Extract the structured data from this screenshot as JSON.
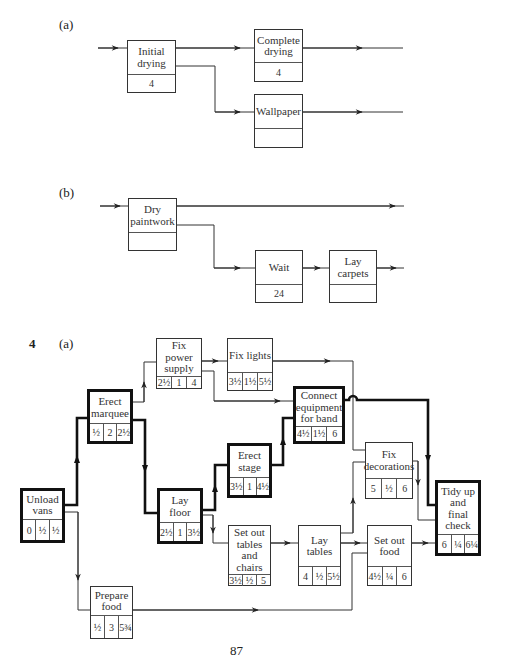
{
  "part_a": {
    "label": "(a)",
    "nodes": {
      "initial_drying": {
        "name": "Initial drying",
        "duration": "4"
      },
      "complete_drying": {
        "name": "Complete drying",
        "duration": "4"
      },
      "wallpaper": {
        "name": "Wallpaper",
        "duration": ""
      }
    }
  },
  "part_b": {
    "label": "(b)",
    "nodes": {
      "dry_paintwork": {
        "name": "Dry paintwork",
        "duration": ""
      },
      "wait": {
        "name": "Wait",
        "duration": "24"
      },
      "lay_carpets": {
        "name": "Lay carpets",
        "duration": ""
      }
    }
  },
  "question4": {
    "number": "4",
    "label": "(a)",
    "nodes": {
      "unload_vans": {
        "name": "Unload vans",
        "est": "0",
        "dur": "½",
        "eft": "½",
        "critical": true
      },
      "erect_marquee": {
        "name": "Erect marquee",
        "est": "½",
        "dur": "2",
        "eft": "2½",
        "critical": true
      },
      "fix_power_supply": {
        "name": "Fix power supply",
        "est": "2½",
        "dur": "1",
        "eft": "4",
        "critical": false
      },
      "fix_lights": {
        "name": "Fix lights",
        "est": "3½",
        "dur": "1½",
        "eft": "5½",
        "critical": false
      },
      "connect_equipment": {
        "name": "Connect equipment for band",
        "est": "4½",
        "dur": "1½",
        "eft": "6",
        "critical": true
      },
      "lay_floor": {
        "name": "Lay floor",
        "est": "2½",
        "dur": "1",
        "eft": "3½",
        "critical": true
      },
      "erect_stage": {
        "name": "Erect stage",
        "est": "3½",
        "dur": "1",
        "eft": "4½",
        "critical": true
      },
      "fix_decorations": {
        "name": "Fix decorations",
        "est": "5",
        "dur": "½",
        "eft": "6",
        "critical": false
      },
      "tidy_up": {
        "name": "Tidy up and final check",
        "est": "6",
        "dur": "¼",
        "eft": "6¼",
        "critical": true
      },
      "set_out_tables": {
        "name": "Set out tables and chairs",
        "est": "3½",
        "dur": "½",
        "eft": "5",
        "critical": false
      },
      "lay_tables": {
        "name": "Lay tables",
        "est": "4",
        "dur": "½",
        "eft": "5½",
        "critical": false
      },
      "set_out_food": {
        "name": "Set out food",
        "est": "4½",
        "dur": "¼",
        "eft": "6",
        "critical": false
      },
      "prepare_food": {
        "name": "Prepare food",
        "est": "½",
        "dur": "3",
        "eft": "5¾",
        "critical": false
      }
    }
  },
  "page_number": "87",
  "colors": {
    "line": "#333333",
    "critical": "#111111",
    "background": "#ffffff"
  }
}
